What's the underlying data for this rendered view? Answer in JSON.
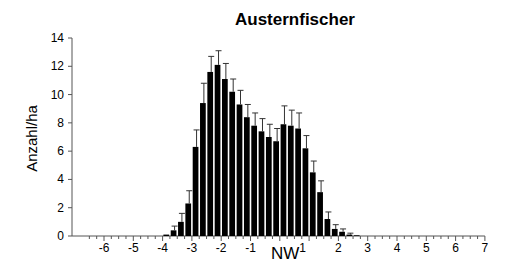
{
  "chart_data": {
    "type": "bar",
    "title": "Austernfischer",
    "xlabel": "NW",
    "xlabel_superscript": "1",
    "ylabel": "Anzahl/ha",
    "ylim": [
      0,
      14
    ],
    "xlim": [
      -6.5,
      7
    ],
    "yticks": [
      0,
      2,
      4,
      6,
      8,
      10,
      12,
      14
    ],
    "xticks": [
      -6,
      -5,
      -4,
      -3,
      -2,
      -1,
      2,
      3,
      4,
      5,
      6,
      7
    ],
    "bin_width": 0.25,
    "grid": false,
    "legend": null,
    "error_bars": true,
    "x": [
      -4.0,
      -3.75,
      -3.5,
      -3.25,
      -3.0,
      -2.75,
      -2.5,
      -2.25,
      -2.0,
      -1.75,
      -1.5,
      -1.25,
      -1.0,
      -0.75,
      -0.5,
      -0.25,
      0.0,
      0.25,
      0.5,
      0.75,
      1.0,
      1.25,
      1.5,
      1.75,
      2.0,
      2.25,
      2.5,
      2.75,
      3.0,
      3.25
    ],
    "values": [
      0.1,
      0.4,
      1.0,
      2.3,
      6.3,
      9.4,
      11.6,
      12.1,
      11.1,
      10.2,
      9.3,
      8.4,
      7.8,
      7.4,
      7.0,
      6.7,
      7.9,
      7.8,
      7.6,
      6.2,
      4.5,
      3.1,
      1.2,
      0.5,
      0.3,
      0.1,
      0.05,
      0.0,
      0.0,
      0.0
    ],
    "errors": [
      0.05,
      0.3,
      0.6,
      0.9,
      1.2,
      1.4,
      1.1,
      1.0,
      1.1,
      0.9,
      1.0,
      0.9,
      0.9,
      0.9,
      0.9,
      0.9,
      1.3,
      1.1,
      1.1,
      0.9,
      0.8,
      0.8,
      0.5,
      0.3,
      0.2,
      0.1,
      0.05,
      0.0,
      0.0,
      0.0
    ]
  }
}
